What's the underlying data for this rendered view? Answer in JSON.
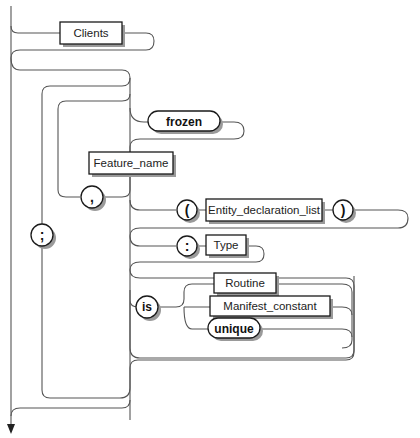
{
  "diagram": {
    "type": "syntax-railroad",
    "nonterminals": {
      "clients": "Clients",
      "feature_name": "Feature_name",
      "entity_declaration_list": "Entity_declaration_list",
      "type": "Type",
      "routine": "Routine",
      "manifest_constant": "Manifest_constant"
    },
    "keywords": {
      "frozen": "frozen",
      "is": "is",
      "unique": "unique"
    },
    "symbols": {
      "semicolon": ";",
      "comma": ",",
      "open_paren": "(",
      "close_paren": ")",
      "colon": ":"
    },
    "colors": {
      "line": "#555555",
      "box_border": "#1a1a1a",
      "shadow": "#9a9a9a"
    }
  }
}
